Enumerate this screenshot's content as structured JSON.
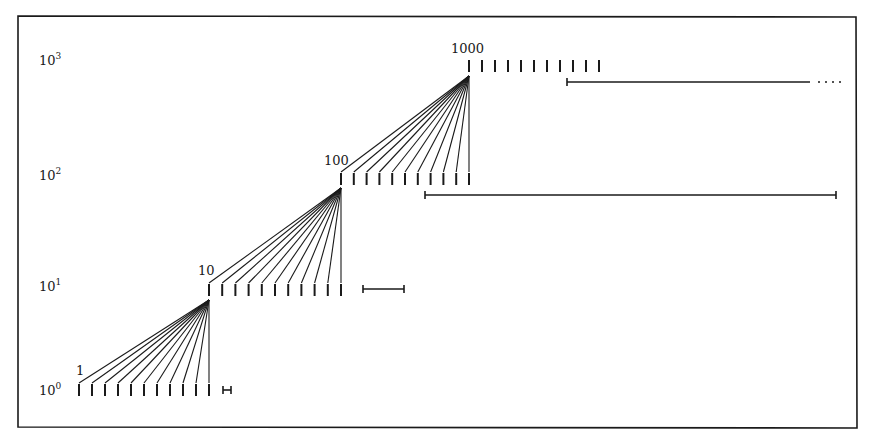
{
  "figure": {
    "type": "diagram",
    "colors": {
      "ink": "#1a1a1a",
      "background": "#ffffff"
    },
    "axis_labels": [
      {
        "base": "10",
        "exp": "0"
      },
      {
        "base": "10",
        "exp": "1"
      },
      {
        "base": "10",
        "exp": "2"
      },
      {
        "base": "10",
        "exp": "3"
      }
    ],
    "levels": [
      {
        "label": "1",
        "value": 1,
        "ticks": 11,
        "interval": "short"
      },
      {
        "label": "10",
        "value": 10,
        "ticks": 11,
        "interval": "short"
      },
      {
        "label": "100",
        "value": 100,
        "ticks": 11,
        "interval": "long"
      },
      {
        "label": "1000",
        "value": 1000,
        "ticks": 11,
        "interval": "long, continues (dotted)"
      }
    ]
  }
}
